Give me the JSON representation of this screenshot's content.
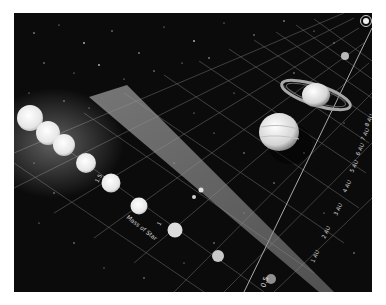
{
  "figure": {
    "axis_star_mass": {
      "label": "Mass of Star",
      "ticks": [
        "0.5",
        "1",
        "1.5"
      ]
    },
    "axis_distance": {
      "ticks": [
        "1 AU",
        "2 AU",
        "3 AU",
        "4 AU",
        "5 AU",
        "6 AU",
        "7 AU",
        "8 AU"
      ]
    },
    "stars": [
      {
        "mass_rank": 1,
        "size": "largest"
      },
      {
        "mass_rank": 2
      },
      {
        "mass_rank": 3
      },
      {
        "mass_rank": 4
      },
      {
        "mass_rank": 5
      },
      {
        "mass_rank": 6
      },
      {
        "mass_rank": 7
      },
      {
        "mass_rank": 8
      },
      {
        "mass_rank": 9,
        "size": "smallest"
      }
    ],
    "planets": [
      "earth-like",
      "jupiter-like",
      "saturn-like",
      "ice-giant",
      "distant-ringed"
    ],
    "zone": "habitable-zone-cone",
    "colors": {
      "background": "#0b0b0b",
      "grid": "#8a8a8a",
      "stars": "#f2f2f2",
      "border": "#ffffff"
    }
  }
}
